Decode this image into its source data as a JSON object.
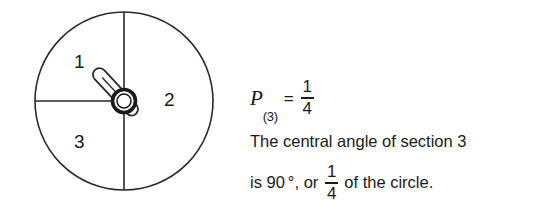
{
  "figure": {
    "name": "spinner-circle-diagram",
    "stroke_color": "#222222",
    "fill_color": "#ffffff",
    "sections": [
      {
        "id": "1",
        "label": "1"
      },
      {
        "id": "2",
        "label": "2"
      },
      {
        "id": "3",
        "label": "3"
      }
    ],
    "geometry": {
      "center_x": 124,
      "center_y": 101,
      "radius": 89,
      "vertical_diameter": true,
      "left_horizontal_radius": true,
      "spinner_angle_label": "down-left"
    }
  },
  "probability": {
    "variable": "P",
    "subscript": "(3)",
    "equals": "=",
    "fraction": {
      "numerator": "1",
      "denominator": "4"
    }
  },
  "explanation": {
    "line1": "The central angle of section 3",
    "line2_prefix": "is 90",
    "degree_symbol": "°",
    "line2_middle": ", or",
    "line2_fraction": {
      "numerator": "1",
      "denominator": "4"
    },
    "line2_suffix": "of the circle."
  }
}
